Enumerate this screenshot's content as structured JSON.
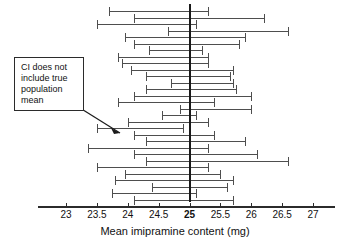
{
  "chart_data": {
    "type": "errorbar",
    "title": "",
    "xlabel": "Mean imipramine content  (mg)",
    "ylabel": "",
    "xlim": [
      22.75,
      27.25
    ],
    "xticks": [
      23,
      23.5,
      24,
      24.5,
      25,
      25.5,
      26,
      26.5,
      27
    ],
    "xtick_labels": [
      "23",
      "23.5",
      "24",
      "24.5",
      "25",
      "25.5",
      "26",
      "26.5",
      "27"
    ],
    "grid": false,
    "legend": null,
    "reference_line": {
      "value": 25,
      "label": "25",
      "orientation": "vertical",
      "color": "#1a1a1a",
      "emphasis": "bold"
    },
    "series_name": "95% confidence intervals for sample means",
    "intervals": [
      {
        "index": 1,
        "low": 23.7,
        "high": 25.3,
        "contains_reference": true
      },
      {
        "index": 2,
        "low": 24.1,
        "high": 26.2,
        "contains_reference": true
      },
      {
        "index": 3,
        "low": 23.5,
        "high": 25.1,
        "contains_reference": true
      },
      {
        "index": 4,
        "low": 24.65,
        "high": 26.6,
        "contains_reference": true
      },
      {
        "index": 5,
        "low": 23.95,
        "high": 25.9,
        "contains_reference": true
      },
      {
        "index": 6,
        "low": 24.1,
        "high": 25.8,
        "contains_reference": true
      },
      {
        "index": 7,
        "low": 24.35,
        "high": 25.2,
        "contains_reference": true
      },
      {
        "index": 8,
        "low": 23.85,
        "high": 25.3,
        "contains_reference": true
      },
      {
        "index": 9,
        "low": 23.9,
        "high": 25.3,
        "contains_reference": true
      },
      {
        "index": 10,
        "low": 24.05,
        "high": 25.7,
        "contains_reference": true
      },
      {
        "index": 11,
        "low": 24.3,
        "high": 25.65,
        "contains_reference": true
      },
      {
        "index": 12,
        "low": 24.7,
        "high": 25.7,
        "contains_reference": true
      },
      {
        "index": 13,
        "low": 24.3,
        "high": 25.75,
        "contains_reference": true
      },
      {
        "index": 14,
        "low": 24.1,
        "high": 26.0,
        "contains_reference": true
      },
      {
        "index": 15,
        "low": 23.85,
        "high": 25.4,
        "contains_reference": true
      },
      {
        "index": 16,
        "low": 24.85,
        "high": 26.0,
        "contains_reference": true
      },
      {
        "index": 17,
        "low": 24.55,
        "high": 25.1,
        "contains_reference": true
      },
      {
        "index": 18,
        "low": 24.0,
        "high": 25.3,
        "contains_reference": true
      },
      {
        "index": 19,
        "low": 23.5,
        "high": 24.9,
        "contains_reference": false
      },
      {
        "index": 20,
        "low": 24.1,
        "high": 25.4,
        "contains_reference": true
      },
      {
        "index": 21,
        "low": 24.3,
        "high": 25.9,
        "contains_reference": true
      },
      {
        "index": 22,
        "low": 23.35,
        "high": 25.3,
        "contains_reference": true
      },
      {
        "index": 23,
        "low": 24.1,
        "high": 26.1,
        "contains_reference": true
      },
      {
        "index": 24,
        "low": 24.3,
        "high": 26.6,
        "contains_reference": true
      },
      {
        "index": 25,
        "low": 23.5,
        "high": 25.3,
        "contains_reference": true
      },
      {
        "index": 26,
        "low": 23.95,
        "high": 25.5,
        "contains_reference": true
      },
      {
        "index": 27,
        "low": 23.8,
        "high": 25.7,
        "contains_reference": true
      },
      {
        "index": 28,
        "low": 24.4,
        "high": 25.6,
        "contains_reference": true
      },
      {
        "index": 29,
        "low": 23.75,
        "high": 25.1,
        "contains_reference": true
      },
      {
        "index": 30,
        "low": 24.1,
        "high": 25.7,
        "contains_reference": true
      }
    ]
  },
  "annotation": {
    "text": "CI does not include true population mean",
    "line1": "CI does not",
    "line2": "include true",
    "line3": "population",
    "line4": "mean",
    "points_to_interval_index": 19
  },
  "colors": {
    "interval": "#4e4e4e",
    "reference": "#1a1a1a",
    "axis": "#2b2b2b",
    "text": "#111111",
    "background": "#ffffff"
  }
}
